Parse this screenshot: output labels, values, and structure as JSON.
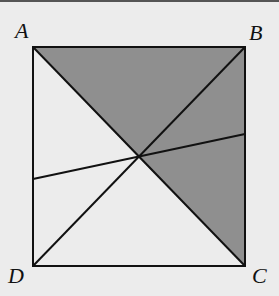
{
  "figure": {
    "type": "geometry-diagram",
    "shape": "square",
    "vertices": {
      "A": {
        "label": "A",
        "x": 33,
        "y": 47
      },
      "B": {
        "label": "B",
        "x": 245,
        "y": 47
      },
      "C": {
        "label": "C",
        "x": 245,
        "y": 266
      },
      "D": {
        "label": "D",
        "x": 33,
        "y": 266
      }
    },
    "center": {
      "x": 138,
      "y": 157
    },
    "transversal": {
      "from": {
        "x": 33,
        "y": 179
      },
      "to": {
        "x": 245,
        "y": 134
      }
    },
    "shaded_regions": [
      "triangle A-B-O",
      "triangle B-C-O"
    ],
    "colors": {
      "background": "#ececec",
      "shade": "#8f8f8f",
      "line": "#111111"
    }
  }
}
